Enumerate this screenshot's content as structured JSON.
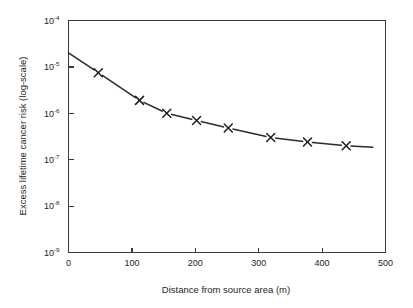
{
  "chart_data": {
    "type": "line",
    "title": "",
    "xlabel": "Distance from source area (m)",
    "ylabel": "Excess lifetime cancer risk (log-scale)",
    "xlim": [
      0,
      500
    ],
    "ylim": [
      1e-09,
      0.0001
    ],
    "yscale": "log",
    "xscale": "linear",
    "grid": false,
    "legend": null,
    "marker": "x",
    "x": [
      0,
      47,
      112,
      155,
      202,
      252,
      319,
      377,
      438,
      480
    ],
    "y": [
      2e-05,
      7.5e-06,
      1.9e-06,
      1e-06,
      7e-07,
      4.8e-07,
      3e-07,
      2.4e-07,
      2e-07,
      1.85e-07
    ],
    "marker_points": [
      {
        "x": 47,
        "y": 7.5e-06
      },
      {
        "x": 112,
        "y": 1.9e-06
      },
      {
        "x": 155,
        "y": 1e-06
      },
      {
        "x": 202,
        "y": 7e-07
      },
      {
        "x": 252,
        "y": 4.8e-07
      },
      {
        "x": 319,
        "y": 3e-07
      },
      {
        "x": 377,
        "y": 2.4e-07
      },
      {
        "x": 438,
        "y": 2e-07
      }
    ],
    "xticks": [
      0,
      100,
      200,
      300,
      400,
      500
    ],
    "xtick_labels": [
      "0",
      "100",
      "200",
      "300",
      "400",
      "500"
    ],
    "yticks": [
      0.0001,
      1e-05,
      1e-06,
      1e-07,
      1e-08,
      1e-09
    ],
    "ytick_labels": [
      {
        "base": "10",
        "exp": "-4"
      },
      {
        "base": "10",
        "exp": "-5"
      },
      {
        "base": "10",
        "exp": "-6"
      },
      {
        "base": "10",
        "exp": "-7"
      },
      {
        "base": "10",
        "exp": "-8"
      },
      {
        "base": "10",
        "exp": "-9"
      }
    ],
    "colors": {
      "line": "#2b2b2b",
      "axis": "#3a3a3a",
      "text": "#231f20",
      "background": "#ffffff"
    }
  }
}
